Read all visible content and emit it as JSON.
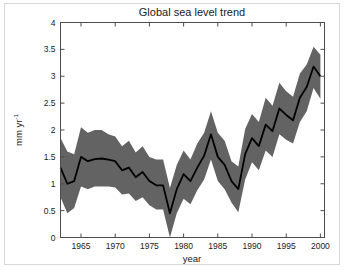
{
  "chart_data": {
    "type": "line",
    "title": "Global sea level trend",
    "xlabel": "year",
    "ylabel": "mm yr-1",
    "ylabel_main": "mm yr",
    "ylabel_exponent": "-1",
    "xlim": [
      1962,
      2000.6
    ],
    "ylim": [
      0,
      4
    ],
    "xticks": [
      1965,
      1970,
      1975,
      1980,
      1985,
      1990,
      1995,
      2000
    ],
    "xticklabels": [
      "1965",
      "1970",
      "1975",
      "1980",
      "1985",
      "1990",
      "1995",
      "2000"
    ],
    "yticks": [
      0,
      0.5,
      1,
      1.5,
      2,
      2.5,
      3,
      3.5,
      4
    ],
    "yticklabels": [
      "0",
      "0.5",
      "1",
      "1.5",
      "2",
      "2.5",
      "3",
      "3.5",
      "4"
    ],
    "grid": false,
    "legend": false,
    "line_color": "#000000",
    "band_color": "#636363",
    "axis_color": "#4d4d4d",
    "x": [
      1962,
      1963,
      1964,
      1965,
      1966,
      1967,
      1968,
      1969,
      1970,
      1971,
      1972,
      1973,
      1974,
      1975,
      1976,
      1977,
      1978,
      1979,
      1980,
      1981,
      1982,
      1983,
      1984,
      1985,
      1986,
      1987,
      1988,
      1989,
      1990,
      1991,
      1992,
      1993,
      1994,
      1995,
      1996,
      1997,
      1998,
      1999,
      2000
    ],
    "series": [
      {
        "name": "trend",
        "values": [
          1.3,
          1.0,
          1.05,
          1.5,
          1.42,
          1.46,
          1.47,
          1.45,
          1.42,
          1.25,
          1.3,
          1.12,
          1.22,
          1.05,
          0.97,
          0.97,
          0.45,
          0.9,
          1.18,
          1.05,
          1.3,
          1.52,
          1.92,
          1.5,
          1.35,
          1.05,
          0.9,
          1.55,
          1.85,
          1.7,
          2.1,
          1.98,
          2.4,
          2.28,
          2.18,
          2.6,
          2.8,
          3.18,
          3.0
        ]
      },
      {
        "name": "upper_bound",
        "values": [
          1.85,
          1.6,
          1.55,
          2.05,
          1.95,
          2.0,
          2.0,
          1.92,
          1.88,
          1.7,
          1.8,
          1.58,
          1.7,
          1.5,
          1.45,
          1.45,
          0.92,
          1.35,
          1.62,
          1.45,
          1.75,
          1.95,
          2.35,
          1.95,
          1.8,
          1.42,
          1.32,
          2.02,
          2.3,
          2.15,
          2.6,
          2.45,
          2.88,
          2.72,
          2.62,
          3.05,
          3.22,
          3.55,
          3.4
        ]
      },
      {
        "name": "lower_bound",
        "values": [
          0.75,
          0.45,
          0.55,
          0.95,
          0.9,
          0.95,
          0.95,
          0.95,
          0.93,
          0.8,
          0.82,
          0.68,
          0.75,
          0.6,
          0.52,
          0.52,
          0.0,
          0.45,
          0.72,
          0.62,
          0.88,
          1.08,
          1.45,
          1.05,
          0.9,
          0.65,
          0.47,
          1.08,
          1.4,
          1.25,
          1.62,
          1.5,
          1.92,
          1.82,
          1.75,
          2.15,
          2.35,
          2.78,
          2.58
        ]
      }
    ]
  }
}
